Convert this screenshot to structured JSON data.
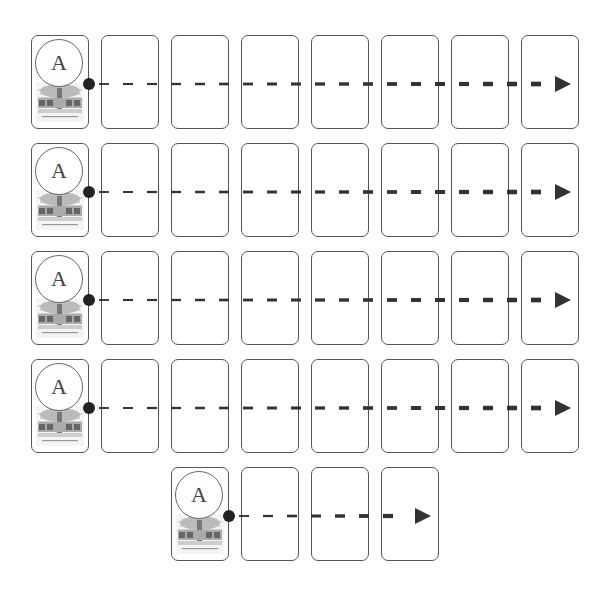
{
  "diagram": {
    "start_card_label": "A",
    "colors": {
      "card_border": "#555555",
      "arrow": "#333333",
      "dot": "#222222"
    },
    "rows": [
      {
        "label": "A",
        "blank_cards": 7
      },
      {
        "label": "A",
        "blank_cards": 7
      },
      {
        "label": "A",
        "blank_cards": 7
      },
      {
        "label": "A",
        "blank_cards": 7
      },
      {
        "label": "A",
        "blank_cards": 3
      }
    ]
  }
}
